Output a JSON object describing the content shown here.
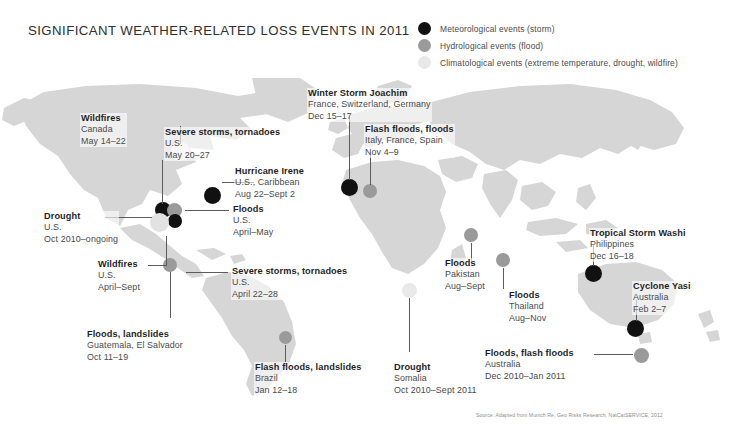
{
  "title": "SIGNIFICANT WEATHER-RELATED LOSS EVENTS IN 2011",
  "legend": {
    "items": [
      {
        "label": "Meteorological events (storm)",
        "color": "#111111",
        "key": "met"
      },
      {
        "label": "Hydrological events (flood)",
        "color": "#9a9a9a",
        "key": "hyd"
      },
      {
        "label": "Climatological events (extreme temperature, drought, wildfire)",
        "color": "#e2e2e2",
        "key": "cli"
      }
    ]
  },
  "source": "Source: Adapted from Munich Re, Geo Risks Research, NatCatSERVICE, 2012",
  "events": [
    {
      "id": "wildfires-canada",
      "title": "Wildfires",
      "place": "Canada",
      "date": "May 14–22",
      "type": "cli"
    },
    {
      "id": "severe-storms-may",
      "title": "Severe storms, tornadoes",
      "place": "U.S.",
      "date": "May 20–27",
      "type": "met"
    },
    {
      "id": "hurricane-irene",
      "title": "Hurricane Irene",
      "place": "U.S., Caribbean",
      "date": "Aug 22–Sept 2",
      "type": "met"
    },
    {
      "id": "floods-us",
      "title": "Floods",
      "place": "U.S.",
      "date": "April–May",
      "type": "hyd"
    },
    {
      "id": "drought-us",
      "title": "Drought",
      "place": "U.S.",
      "date": "Oct 2010–ongoing",
      "type": "cli"
    },
    {
      "id": "wildfires-us",
      "title": "Wildfires",
      "place": "U.S.",
      "date": "April–Sept",
      "type": "cli"
    },
    {
      "id": "severe-storms-april",
      "title": "Severe storms, tornadoes",
      "place": "U.S.",
      "date": "April 22–28",
      "type": "met"
    },
    {
      "id": "floods-guatemala",
      "title": "Floods, landslides",
      "place": "Guatemala, El Salvador",
      "date": "Oct 11–19",
      "type": "hyd"
    },
    {
      "id": "flash-floods-brazil",
      "title": "Flash floods, landslides",
      "place": "Brazil",
      "date": "Jan 12–18",
      "type": "hyd"
    },
    {
      "id": "winter-storm-joachim",
      "title": "Winter Storm Joachim",
      "place": "France, Switzerland, Germany",
      "date": "Dec 15–17",
      "type": "met"
    },
    {
      "id": "flash-floods-italy",
      "title": "Flash floods, floods",
      "place": "Italy, France, Spain",
      "date": "Nov 4–9",
      "type": "hyd"
    },
    {
      "id": "drought-somalia",
      "title": "Drought",
      "place": "Somalia",
      "date": "Oct 2010–Sept 2011",
      "type": "cli"
    },
    {
      "id": "floods-pakistan",
      "title": "Floods",
      "place": "Pakistan",
      "date": "Aug–Sept",
      "type": "hyd"
    },
    {
      "id": "floods-thailand",
      "title": "Floods",
      "place": "Thailand",
      "date": "Aug–Nov",
      "type": "hyd"
    },
    {
      "id": "tropical-storm-washi",
      "title": "Tropical Storm Washi",
      "place": "Philippines",
      "date": "Dec 16–18",
      "type": "met"
    },
    {
      "id": "cyclone-yasi",
      "title": "Cyclone Yasi",
      "place": "Australia",
      "date": "Feb 2–7",
      "type": "met"
    },
    {
      "id": "floods-australia",
      "title": "Floods, flash floods",
      "place": "Australia",
      "date": "Dec 2010–Jan 2011",
      "type": "hyd"
    }
  ]
}
